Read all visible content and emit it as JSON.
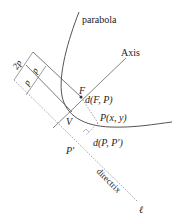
{
  "diagram": {
    "labels": {
      "parabola": "parabola",
      "axis": "Axis",
      "focus": "F",
      "vertex": "V",
      "point": "P(x, y)",
      "foot": "P′",
      "dist_fp": "d(F, P)",
      "dist_pp": "d(P, P′)",
      "directrix": "directrix",
      "directrix_symbol": "ℓ",
      "dim_2p": "2p",
      "dim_p1": "p",
      "dim_p2": "p"
    },
    "colors": {
      "stroke": "#555555",
      "dotted": "#888888",
      "text": "#222222",
      "background": "#ffffff"
    }
  }
}
